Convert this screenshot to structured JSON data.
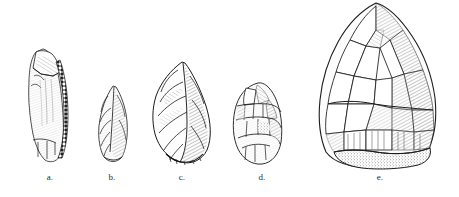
{
  "plate": {
    "kind": "archaeological-line-drawing",
    "subject": "Chipped stone tools (lithics)",
    "background_color": "#ffffff",
    "ink_color": "#1b1b1b",
    "shade_colors": [
      "#555555",
      "#6e6e6e",
      "#8a8a8a",
      "#a8a8a8",
      "#c8c8c8"
    ],
    "artifact_count": 5
  },
  "artifacts": [
    {
      "label": "a.",
      "name": "retouched-flake-scraper",
      "label_x": 50,
      "label_y": 176,
      "box": {
        "x": 27,
        "y": 48,
        "w": 36,
        "h": 115
      },
      "description": "Elongated flake with steeply retouched denticulate right edge"
    },
    {
      "label": "b.",
      "name": "small-leaf-point",
      "label_x": 112,
      "label_y": 176,
      "box": {
        "x": 96,
        "y": 85,
        "w": 32,
        "h": 78
      },
      "description": "Small pointed leaf-shaped point"
    },
    {
      "label": "c.",
      "name": "pointed-biface",
      "label_x": 182,
      "label_y": 176,
      "box": {
        "x": 152,
        "y": 60,
        "w": 58,
        "h": 105
      },
      "description": "Pointed biface with hatched right face"
    },
    {
      "label": "d.",
      "name": "ovate-biface",
      "label_x": 262,
      "label_y": 176,
      "box": {
        "x": 232,
        "y": 82,
        "w": 50,
        "h": 83
      },
      "description": "Ovate teardrop biface"
    },
    {
      "label": "e.",
      "name": "large-handaxe",
      "label_x": 380,
      "label_y": 176,
      "box": {
        "x": 318,
        "y": 2,
        "w": 120,
        "h": 164
      },
      "description": "Large cordiform handaxe with stippled cortical base"
    }
  ]
}
